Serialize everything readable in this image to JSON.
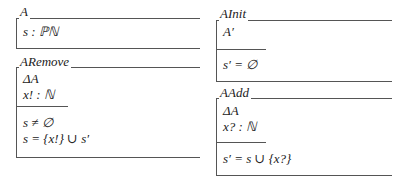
{
  "schemas": {
    "A": {
      "name": "A",
      "declarations": [
        "s : ℙℕ"
      ],
      "predicates": []
    },
    "ARemove": {
      "name": "ARemove",
      "declarations": [
        "ΔA",
        "x! : ℕ"
      ],
      "predicates": [
        "s ≠ ∅",
        "s = {x!} ∪ s′"
      ]
    },
    "AInit": {
      "name": "AInit",
      "declarations": [
        "A′"
      ],
      "predicates": [
        "s′ = ∅"
      ]
    },
    "AAdd": {
      "name": "AAdd",
      "declarations": [
        "ΔA",
        "x? : ℕ"
      ],
      "predicates": [
        "s′ = s ∪ {x?}"
      ]
    }
  },
  "colors": {
    "line": "#555555",
    "text": "#222222",
    "background": "#ffffff"
  }
}
